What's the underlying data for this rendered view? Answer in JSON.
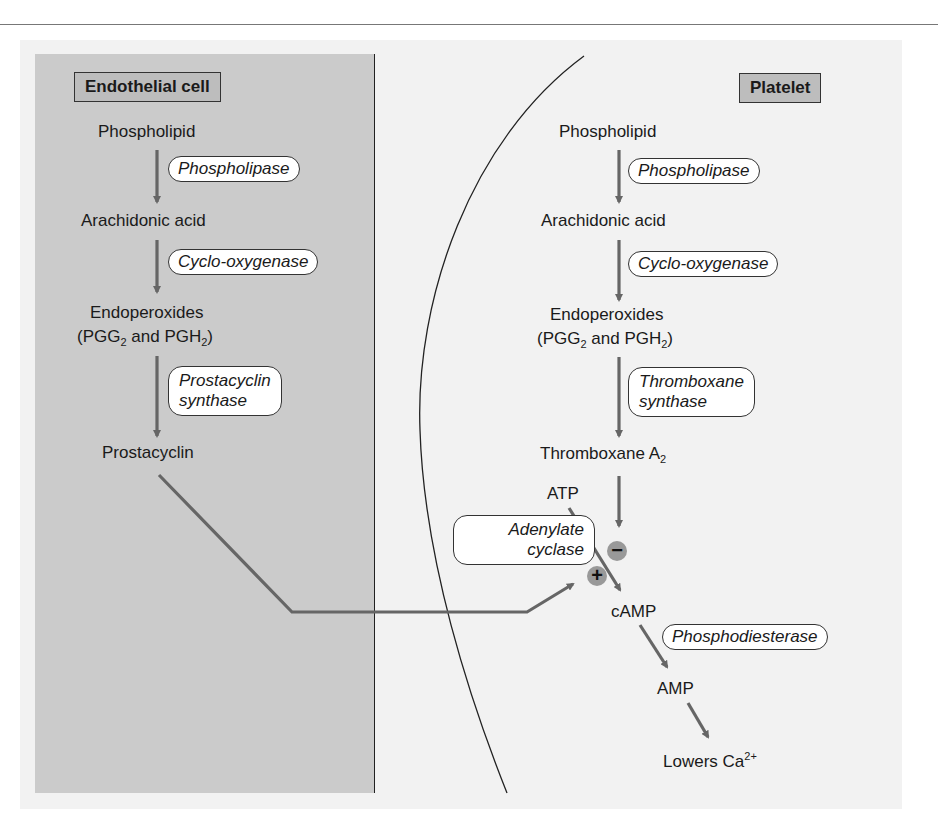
{
  "diagram": {
    "compartments": {
      "left": "Endothelial cell",
      "right": "Platelet"
    },
    "endothelial": {
      "steps": [
        "Phospholipid",
        "Arachidonic acid",
        "Endoperoxides",
        "(PGG",
        "2",
        " and PGH",
        "2",
        ")",
        "Prostacyclin"
      ],
      "enzymes": [
        "Phospholipase",
        "Cyclo-oxygenase",
        "Prostacyclin",
        "synthase"
      ]
    },
    "platelet": {
      "steps": [
        "Phospholipid",
        "Arachidonic acid",
        "Endoperoxides",
        "(PGG",
        "2",
        " and PGH",
        "2",
        ")",
        "Thromboxane A",
        "2",
        "ATP",
        "cAMP",
        "AMP",
        "Lowers Ca",
        "2+"
      ],
      "enzymes": [
        "Phospholipase",
        "Cyclo-oxygenase",
        "Thromboxane",
        "synthase",
        "Adenylate",
        "cyclase",
        "Phosphodiesterase"
      ],
      "modulators": {
        "stimulate": "+",
        "inhibit": "−"
      }
    },
    "colors": {
      "arrow": "#666666",
      "endothelial_bg": "#cbcbcb",
      "panel_bg": "#f2f2f2",
      "badge": "#999999"
    }
  }
}
